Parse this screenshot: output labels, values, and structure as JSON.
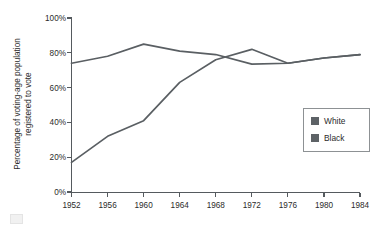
{
  "chart_data": {
    "type": "line",
    "title": "",
    "xlabel": "",
    "ylabel": "Percentage of voting-age population registered to vote",
    "ylabel_line1": "Percentage of voting-age population",
    "ylabel_line2": "registered to vote",
    "x": [
      1952,
      1956,
      1960,
      1964,
      1968,
      1972,
      1976,
      1980,
      1984
    ],
    "categories": [
      "1952",
      "1956",
      "1960",
      "1964",
      "1968",
      "1972",
      "1976",
      "1980",
      "1984"
    ],
    "xlim": [
      1952,
      1984
    ],
    "ylim": [
      0,
      100
    ],
    "ytick_values": [
      0,
      20,
      40,
      60,
      80,
      100
    ],
    "ytick_labels": [
      "0%",
      "20%",
      "40%",
      "60%",
      "80%",
      "100%"
    ],
    "grid": false,
    "legend_position": "right-middle",
    "series": [
      {
        "name": "White",
        "color": "#5a5f63",
        "values": [
          74,
          78,
          85,
          81,
          79,
          73.5,
          74,
          77,
          79
        ]
      },
      {
        "name": "Black",
        "color": "#5a5f63",
        "values": [
          17,
          32,
          41,
          63,
          76,
          82,
          74,
          77,
          79
        ]
      }
    ]
  },
  "legend": {
    "entries": [
      {
        "label": "White",
        "swatch_color": "#5d6266"
      },
      {
        "label": "Black",
        "swatch_color": "#5d6266"
      }
    ]
  },
  "colors": {
    "axis": "#555a5e",
    "text": "#2b2b2b",
    "series_line": "#5a5f63",
    "legend_border": "#8d9194",
    "background": "#ffffff"
  }
}
